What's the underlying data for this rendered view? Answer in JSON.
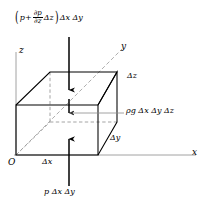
{
  "figure": {
    "axes": {
      "origin_label": "O",
      "x_label": "x",
      "y_label": "y",
      "z_label": "z"
    },
    "dimensions": {
      "dx": "Δx",
      "dy": "Δy",
      "dz": "Δz"
    },
    "labels": {
      "top_force": {
        "open_paren": "(",
        "p": "p",
        "plus": "+",
        "frac_num": "∂p",
        "frac_den": "∂z",
        "dz": "Δz",
        "close_paren": ")",
        "suffix": "Δx Δy",
        "full_text": "(p + ∂p/∂z Δz) Δx Δy"
      },
      "bottom_force": "p Δx Δy",
      "weight": "ρg Δx Δy Δz"
    },
    "colors": {
      "stroke": "#000000",
      "hidden_edge": "#9a9a9a",
      "axis": "#7f7f7f",
      "background": "#ffffff"
    }
  }
}
